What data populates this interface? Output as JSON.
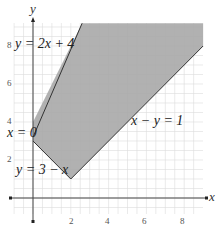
{
  "chart_data": {
    "type": "area",
    "title": "",
    "xlabel": "x",
    "ylabel": "y",
    "xlim": [
      -1,
      9
    ],
    "ylim": [
      -1,
      9.2
    ],
    "grid": true,
    "x_ticks": [
      2,
      4,
      6,
      8
    ],
    "y_ticks": [
      2,
      4,
      6,
      8
    ],
    "x_tick_labels": [
      "2",
      "4",
      "6",
      "8"
    ],
    "y_tick_labels": [
      "2",
      "4",
      "6",
      "8"
    ],
    "feasible_region": {
      "description": "Shaded feasible region bounded by x=0, y=3-x, x-y=1, y=2x+4 (unbounded upward)",
      "vertices": [
        [
          0,
          4
        ],
        [
          0,
          3
        ],
        [
          2,
          1
        ],
        [
          9,
          8
        ],
        [
          9,
          9.2
        ],
        [
          2.6,
          9.2
        ]
      ],
      "fill_color": "#a8a8a8"
    },
    "boundary_lines": [
      {
        "equation": "y = 2x + 4",
        "label": "y=2x+4"
      },
      {
        "equation": "x = 0",
        "label": "x=0"
      },
      {
        "equation": "y = 3 - x",
        "label": "y=3−x"
      },
      {
        "equation": "x - y = 1",
        "label": "x−y=1"
      }
    ],
    "annotations": [
      {
        "text": "y=2x+4",
        "near": [
          0.2,
          8
        ]
      },
      {
        "text": "x=0",
        "near": [
          -1,
          3.5
        ]
      },
      {
        "text": "y=3−x",
        "near": [
          -1,
          1.4
        ]
      },
      {
        "text": "x−y=1",
        "near": [
          4.9,
          4.7
        ]
      }
    ]
  },
  "labels": {
    "x_axis": "x",
    "y_axis": "y",
    "eq1": "y = 2x + 4",
    "eq2": "x = 0",
    "eq3": "y = 3 − x",
    "eq4": "x − y = 1",
    "tick_x": [
      "2",
      "4",
      "6",
      "8"
    ],
    "tick_y": [
      "2",
      "4",
      "6",
      "8"
    ]
  }
}
